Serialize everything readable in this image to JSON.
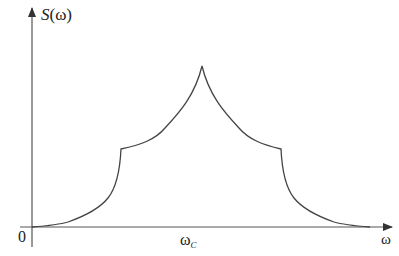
{
  "diagram": {
    "axes": {
      "y_label_fn": "S",
      "y_label_arg": "(ω)",
      "x_label": "ω",
      "origin_label": "0",
      "center_label_main": "ω",
      "center_label_sub": "C"
    },
    "colors": {
      "axis": "#555555",
      "curve": "#444444",
      "background": "#ffffff"
    },
    "curve": {
      "description": "Symmetric spectrum: near-zero tails, steep rise to flat-ish shoulders, then cusp peak at ω_C",
      "points": {
        "left_tail_start": [
          32,
          227
        ],
        "left_shoulder": [
          121,
          149
        ],
        "peak": [
          202,
          66
        ],
        "right_shoulder": [
          281,
          149
        ],
        "right_tail_end": [
          370,
          227
        ]
      }
    }
  }
}
